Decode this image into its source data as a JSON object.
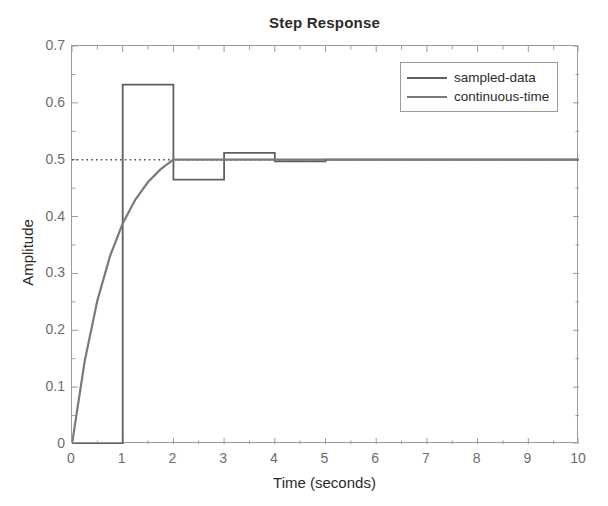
{
  "chart_data": {
    "type": "line",
    "title": "Step Response",
    "xlabel": "Time (seconds)",
    "ylabel": "Amplitude",
    "xlim": [
      0,
      10
    ],
    "ylim": [
      0,
      0.7
    ],
    "grid": false,
    "legend_position": "top-right",
    "xticks": [
      "0",
      "1",
      "2",
      "3",
      "4",
      "5",
      "6",
      "7",
      "8",
      "9",
      "10"
    ],
    "xtick_values": [
      0,
      1,
      2,
      3,
      4,
      5,
      6,
      7,
      8,
      9,
      10
    ],
    "yticks": [
      "0",
      "0.1",
      "0.2",
      "0.3",
      "0.4",
      "0.5",
      "0.6",
      "0.7"
    ],
    "ytick_values": [
      0,
      0.1,
      0.2,
      0.3,
      0.4,
      0.5,
      0.6,
      0.7
    ],
    "reference_line": {
      "name": "steady-state",
      "orientation": "horizontal",
      "value": 0.5,
      "style": "dotted",
      "color": "#4d4d4d"
    },
    "series": [
      {
        "name": "sampled-data",
        "style": "staircase",
        "color": "#606060",
        "sample_time": 1,
        "x": [
          0,
          1,
          2,
          3,
          4,
          5,
          6,
          7,
          8,
          9,
          10
        ],
        "values": [
          0,
          0.632,
          0.465,
          0.512,
          0.497,
          0.5,
          0.5,
          0.5,
          0.5,
          0.5,
          0.5
        ]
      },
      {
        "name": "continuous-time",
        "style": "solid",
        "color": "#7a7a7a",
        "x": [
          0,
          0.25,
          0.5,
          0.75,
          1,
          1.25,
          1.5,
          1.75,
          2,
          2.25,
          2.5,
          2.75,
          3,
          3.5,
          4,
          4.5,
          5,
          6,
          7,
          8,
          9,
          10
        ],
        "values": [
          0,
          0.1455,
          0.2522,
          0.3305,
          0.3879,
          0.4299,
          0.4608,
          0.4834,
          0.5,
          0.5,
          0.5,
          0.5,
          0.5,
          0.5,
          0.5,
          0.5,
          0.5,
          0.5,
          0.5,
          0.5,
          0.5,
          0.5
        ]
      }
    ]
  },
  "legend": {
    "items": [
      {
        "label": "sampled-data",
        "color": "#606060"
      },
      {
        "label": "continuous-time",
        "color": "#7a7a7a"
      }
    ]
  },
  "axes": {
    "box_color": "#9b9b9b",
    "tick_color": "#9b9b9b",
    "label_color": "#6d6d6d"
  }
}
